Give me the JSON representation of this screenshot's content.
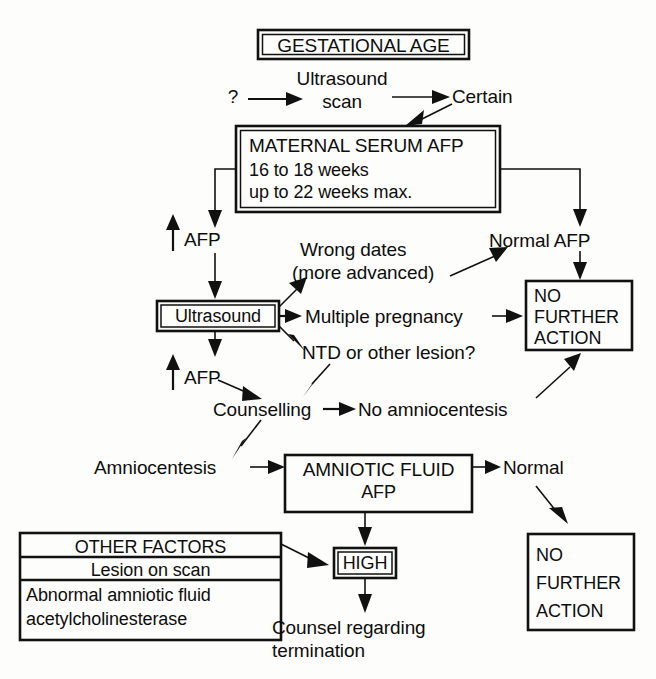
{
  "diagram": {
    "background_color": "#fdfdfc",
    "ink_color": "#111111"
  },
  "nodes": {
    "gestational_age": {
      "label": "GESTATIONAL AGE",
      "style": "double-box"
    },
    "ultrasound_scan": {
      "line1": "Ultrasound",
      "line2": "scan",
      "style": "plain"
    },
    "question_mark": {
      "label": "?",
      "style": "plain"
    },
    "certain": {
      "label": "Certain",
      "style": "plain"
    },
    "maternal_serum_afp": {
      "title": "MATERNAL SERUM AFP",
      "line2": "16 to 18 weeks",
      "line3": "up to 22 weeks max.",
      "style": "double-box"
    },
    "raised_afp_1": {
      "arrow": "↑",
      "label": "AFP",
      "style": "plain"
    },
    "normal_afp": {
      "label": "Normal AFP",
      "style": "plain"
    },
    "ultrasound_box": {
      "label": "Ultrasound",
      "style": "double-box"
    },
    "wrong_dates": {
      "line1": "Wrong dates",
      "line2": "(more advanced)",
      "style": "plain"
    },
    "multiple_pregnancy": {
      "label": "Multiple pregnancy",
      "style": "plain"
    },
    "ntd_or_other_lesion": {
      "label": "NTD or other lesion?",
      "style": "plain"
    },
    "raised_afp_2": {
      "arrow": "↑",
      "label": "AFP",
      "style": "plain"
    },
    "counselling": {
      "label": "Counselling",
      "style": "plain"
    },
    "no_amniocentesis": {
      "label": "No amniocentesis",
      "style": "plain"
    },
    "no_further_action_top": {
      "line1": "NO",
      "line2": "FURTHER",
      "line3": "ACTION",
      "style": "box"
    },
    "amniocentesis": {
      "label": "Amniocentesis",
      "style": "plain"
    },
    "amniotic_fluid_afp": {
      "title": "AMNIOTIC FLUID",
      "line2": "AFP",
      "style": "box"
    },
    "normal": {
      "label": "Normal",
      "style": "plain"
    },
    "no_further_action_bottom": {
      "line1": "NO",
      "line2": "FURTHER",
      "line3": "ACTION",
      "style": "box"
    },
    "other_factors": {
      "header": "OTHER FACTORS",
      "row1": "Lesion on scan",
      "row2_line1": "Abnormal amniotic fluid",
      "row2_line2": "acetylcholinesterase",
      "style": "table-box"
    },
    "high": {
      "label": "HIGH",
      "style": "double-box"
    },
    "counsel_termination": {
      "line1": "Counsel regarding",
      "line2": "termination",
      "style": "plain"
    }
  },
  "edges": [
    {
      "from": "question_mark",
      "to": "ultrasound_scan",
      "kind": "straight-right"
    },
    {
      "from": "ultrasound_scan",
      "to": "certain",
      "kind": "straight-right"
    },
    {
      "from": "certain",
      "to": "maternal_serum_afp",
      "kind": "diagonal-down-left"
    },
    {
      "from": "maternal_serum_afp",
      "to": "raised_afp_1",
      "kind": "elbow-left-down"
    },
    {
      "from": "maternal_serum_afp",
      "to": "normal_afp",
      "kind": "elbow-right-down"
    },
    {
      "from": "raised_afp_1",
      "to": "ultrasound_box",
      "kind": "straight-down"
    },
    {
      "from": "normal_afp",
      "to": "no_further_action_top",
      "kind": "straight-down"
    },
    {
      "from": "ultrasound_box",
      "to": "wrong_dates",
      "kind": "diagonal-up-right"
    },
    {
      "from": "ultrasound_box",
      "to": "multiple_pregnancy",
      "kind": "straight-right"
    },
    {
      "from": "ultrasound_box",
      "to": "ntd_or_other_lesion",
      "kind": "diagonal-down-right"
    },
    {
      "from": "ultrasound_box",
      "to": "raised_afp_2",
      "kind": "straight-down"
    },
    {
      "from": "wrong_dates",
      "to": "normal_afp",
      "kind": "diagonal-up-right"
    },
    {
      "from": "multiple_pregnancy",
      "to": "no_further_action_top",
      "kind": "straight-right"
    },
    {
      "from": "ntd_or_other_lesion",
      "to": "counselling",
      "kind": "diagonal-down-left"
    },
    {
      "from": "raised_afp_2",
      "to": "counselling",
      "kind": "diagonal-down-right"
    },
    {
      "from": "counselling",
      "to": "no_amniocentesis",
      "kind": "straight-right"
    },
    {
      "from": "no_amniocentesis",
      "to": "no_further_action_top",
      "kind": "diagonal-up-right"
    },
    {
      "from": "counselling",
      "to": "amniocentesis",
      "kind": "diagonal-down-left"
    },
    {
      "from": "amniocentesis",
      "to": "amniotic_fluid_afp",
      "kind": "straight-right"
    },
    {
      "from": "amniotic_fluid_afp",
      "to": "normal",
      "kind": "straight-right"
    },
    {
      "from": "normal",
      "to": "no_further_action_bottom",
      "kind": "diagonal-down-right"
    },
    {
      "from": "amniotic_fluid_afp",
      "to": "high",
      "kind": "straight-down"
    },
    {
      "from": "other_factors",
      "to": "high",
      "kind": "diagonal-down-right"
    },
    {
      "from": "high",
      "to": "counsel_termination",
      "kind": "straight-down"
    }
  ]
}
